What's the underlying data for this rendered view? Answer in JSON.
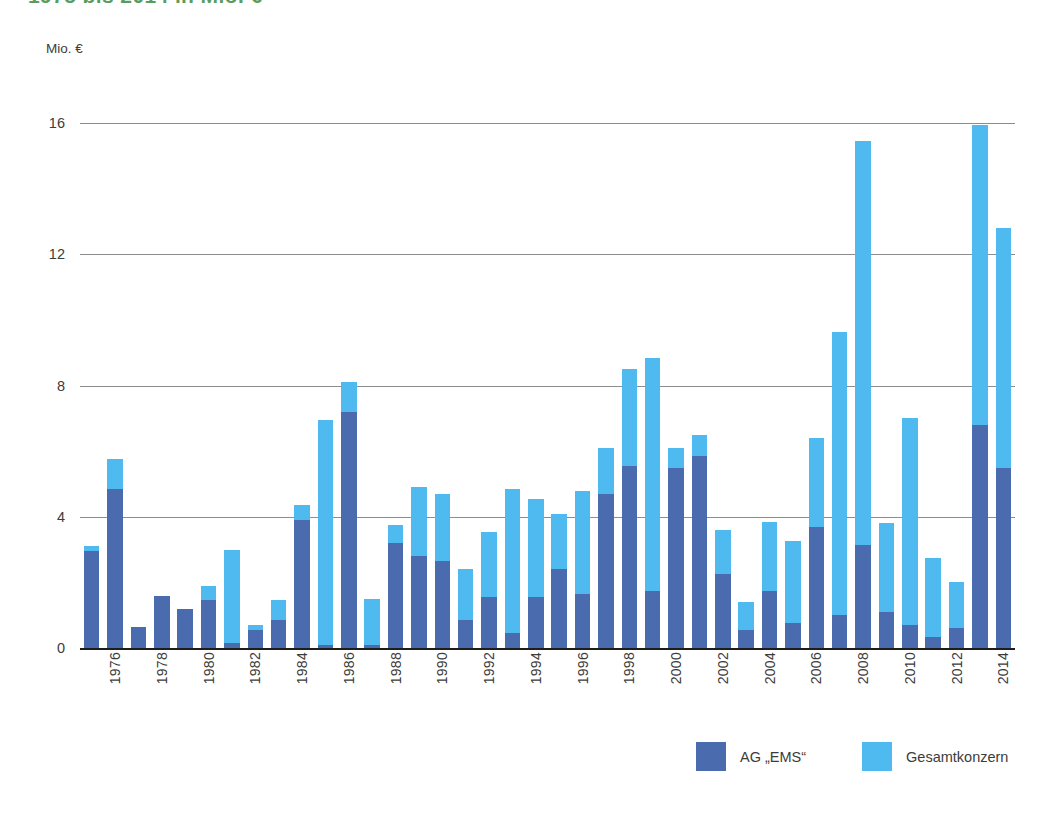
{
  "title": "1975 bis 2014 in Mio. €",
  "y_axis": {
    "unit_label": "Mio. €",
    "ticks": [
      "0",
      "4",
      "8",
      "12",
      "16"
    ]
  },
  "legend": {
    "items": [
      {
        "label": "AG „EMS“",
        "color": "#4a6cae",
        "swatch_name": "legend-swatch-ag-ems"
      },
      {
        "label": "Gesamtkonzern",
        "color": "#4fbaf0",
        "swatch_name": "legend-swatch-gesamtkonzern"
      }
    ]
  },
  "colors": {
    "dark_blue": "#4a6cae",
    "light_blue": "#4fbaf0",
    "gridline": "#8c8c8c",
    "axis": "#1d1d1b",
    "title_green": "#5a9c5e",
    "text": "#3c3c3b"
  },
  "chart_data": {
    "type": "bar",
    "stacked": true,
    "title": "1975 bis 2014 in Mio. €",
    "xlabel": "",
    "ylabel": "Mio. €",
    "ylim": [
      0,
      16.8
    ],
    "yticks": [
      0,
      4,
      8,
      12,
      16
    ],
    "grid": "horizontal",
    "legend_position": "bottom-right",
    "x_tick_labels_shown": [
      "1976",
      "1978",
      "1980",
      "1982",
      "1984",
      "1986",
      "1988",
      "1990",
      "1992",
      "1994",
      "1996",
      "1998",
      "2000",
      "2002",
      "2004",
      "2006",
      "2008",
      "2010",
      "2012",
      "2014"
    ],
    "categories": [
      "1975",
      "1976",
      "1977",
      "1978",
      "1979",
      "1980",
      "1981",
      "1982",
      "1983",
      "1984",
      "1985",
      "1986",
      "1987",
      "1988",
      "1989",
      "1990",
      "1991",
      "1992",
      "1993",
      "1994",
      "1995",
      "1996",
      "1997",
      "1998",
      "1999",
      "2000",
      "2001",
      "2002",
      "2003",
      "2004",
      "2005",
      "2006",
      "2007",
      "2008",
      "2009",
      "2010",
      "2011",
      "2012",
      "2013",
      "2014"
    ],
    "series": [
      {
        "name": "AG „EMS“",
        "color": "#4a6cae",
        "values": [
          2.95,
          4.85,
          0.65,
          1.6,
          1.2,
          1.45,
          0.15,
          0.55,
          0.85,
          3.9,
          0.1,
          7.2,
          0.1,
          3.2,
          2.8,
          2.65,
          0.85,
          1.55,
          0.45,
          1.55,
          2.4,
          1.65,
          4.7,
          5.55,
          1.75,
          5.5,
          5.85,
          2.25,
          0.55,
          1.75,
          0.75,
          3.7,
          1.0,
          3.15,
          1.1,
          0.7,
          0.35,
          0.6,
          6.8,
          5.5
        ]
      },
      {
        "name": "Gesamtkonzern",
        "color": "#4fbaf0",
        "values": [
          3.1,
          5.75,
          0.65,
          1.6,
          1.2,
          1.9,
          3.0,
          0.7,
          1.45,
          4.35,
          6.95,
          8.1,
          1.5,
          3.75,
          4.9,
          4.7,
          2.4,
          3.55,
          4.85,
          4.55,
          4.1,
          4.8,
          6.1,
          8.5,
          8.85,
          6.1,
          6.5,
          3.6,
          1.4,
          3.85,
          3.25,
          6.4,
          9.65,
          15.45,
          3.8,
          7.0,
          2.75,
          2.0,
          15.95,
          12.8
        ]
      }
    ]
  }
}
